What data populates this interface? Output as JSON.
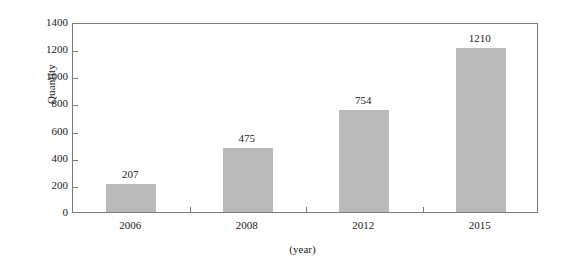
{
  "chart_data": {
    "type": "bar",
    "title": "",
    "subtitle": "",
    "xlabel": "(year)",
    "ylabel": "Quantity",
    "categories": [
      "2006",
      "2008",
      "2012",
      "2015"
    ],
    "values": [
      207,
      475,
      754,
      1210
    ],
    "value_labels": [
      "207",
      "475",
      "754",
      "1210"
    ],
    "ylim": [
      0,
      1400
    ],
    "ytick_labels": [
      "0",
      "200",
      "400",
      "600",
      "800",
      "1000",
      "1200",
      "1400"
    ],
    "ytick_values": [
      0,
      200,
      400,
      600,
      800,
      1000,
      1200,
      1400
    ],
    "grid": false,
    "legend": null,
    "legend_position": "none",
    "series": [
      {
        "name": "Quantity",
        "values": [
          207,
          475,
          754,
          1210
        ]
      }
    ],
    "colors": {
      "bar_fill": "#b9b9b9",
      "axis_line": "#7a7a7a",
      "text": "#1a1a1a",
      "background": "#ffffff"
    }
  }
}
